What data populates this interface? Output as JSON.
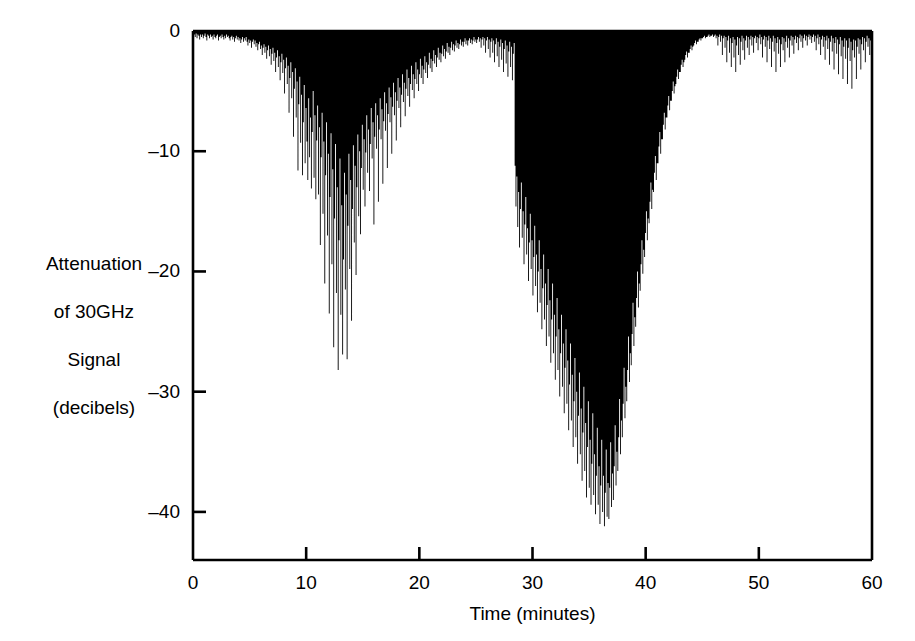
{
  "chart_data": {
    "type": "area",
    "title": "",
    "subtitle": "",
    "xlabel": "Time (minutes)",
    "ylabel": "Attenuation of 30GHz Signal (decibels)",
    "ylabel_lines": [
      "Attenuation",
      "of 30GHz",
      "Signal",
      "(decibels)"
    ],
    "xlim": [
      0,
      60
    ],
    "ylim": [
      -44,
      0
    ],
    "xticks": [
      0,
      10,
      20,
      30,
      40,
      50,
      60
    ],
    "xticklabels": [
      "0",
      "10",
      "20",
      "30",
      "40",
      "50",
      "60"
    ],
    "yticks": [
      0,
      -10,
      -20,
      -30,
      -40
    ],
    "yticklabels": [
      "0",
      "-10",
      "-20",
      "-30",
      "-40"
    ],
    "grid": false,
    "legend": null,
    "legend_position": "none",
    "fill_color": "#000000",
    "axis_color": "#000000",
    "background_color": "#ffffff",
    "series": [
      {
        "name": "30GHz signal attenuation",
        "units": "dB",
        "x_units": "minutes",
        "sample_interval_minutes": 0.1,
        "baseline": 0,
        "description": "Rain-fade record of a 30 GHz satellite beacon over one hour. Two deep fade events: the first near minutes 12-16 reaching about -28 dB, the second near minutes 38-44 reaching about -41 dB.",
        "annotations": [
          "Quiet baseline 0 to -1 dB from 0 to 6 min",
          "First fade onset approx 7 min, peak depth -28 dB near 13.5 min",
          "Partial recovery 17-22 min to about -6 dB",
          "Quiet interval 23-35 min, 0 to -4 dB",
          "Second fade sharp onset approx 36 min",
          "Deepest attenuation -41 dB near 42 min",
          "Recovery by 46 min, residual 0 to -5 dB through 60 min"
        ],
        "values": [
          -0.4,
          -0.3,
          -0.5,
          -0.2,
          -0.6,
          -0.3,
          -0.4,
          -0.7,
          -0.3,
          -0.5,
          -0.3,
          -0.6,
          -0.4,
          -0.2,
          -0.5,
          -0.8,
          -0.3,
          -0.4,
          -0.6,
          -0.3,
          -0.5,
          -0.4,
          -0.7,
          -0.3,
          -0.5,
          -0.6,
          -0.4,
          -0.3,
          -0.8,
          -0.5,
          -0.4,
          -0.6,
          -0.3,
          -0.5,
          -0.7,
          -0.4,
          -0.6,
          -0.3,
          -0.5,
          -0.4,
          -0.6,
          -0.8,
          -0.5,
          -0.4,
          -0.7,
          -0.5,
          -0.9,
          -0.6,
          -0.4,
          -0.7,
          -0.5,
          -0.8,
          -0.6,
          -1.0,
          -0.7,
          -0.5,
          -0.9,
          -0.6,
          -0.8,
          -0.5,
          -0.9,
          -1.2,
          -0.7,
          -1.0,
          -0.8,
          -1.4,
          -0.9,
          -0.7,
          -1.1,
          -0.8,
          -1.3,
          -1.0,
          -1.6,
          -1.1,
          -0.9,
          -1.5,
          -1.2,
          -2.0,
          -1.4,
          -1.1,
          -1.8,
          -1.3,
          -2.3,
          -1.6,
          -1.2,
          -2.1,
          -1.5,
          -2.8,
          -1.9,
          -1.4,
          -2.5,
          -1.8,
          -3.4,
          -2.2,
          -1.6,
          -3.0,
          -2.1,
          -4.1,
          -2.6,
          -1.9,
          -3.5,
          -2.4,
          -5.2,
          -3.1,
          -2.2,
          -4.4,
          -2.9,
          -6.8,
          -3.9,
          -2.6,
          -5.6,
          -3.4,
          -8.8,
          -4.8,
          -3.1,
          -7.2,
          -4.2,
          -11.6,
          -6.1,
          -3.8,
          -9.3,
          -5.3,
          -12.0,
          -7.6,
          -4.5,
          -11.0,
          -6.4,
          -9.2,
          -12.4,
          -5.6,
          -10.5,
          -7.2,
          -13.1,
          -8.4,
          -5.0,
          -12.2,
          -7.0,
          -14.0,
          -9.1,
          -6.2,
          -13.6,
          -8.0,
          -17.8,
          -10.5,
          -6.8,
          -15.2,
          -9.2,
          -21.0,
          -12.0,
          -7.6,
          -17.0,
          -10.2,
          -23.5,
          -13.8,
          -8.5,
          -19.4,
          -11.5,
          -26.3,
          -15.6,
          -9.4,
          -21.8,
          -13.0,
          -28.2,
          -17.4,
          -10.6,
          -23.6,
          -14.5,
          -26.9,
          -19.0,
          -11.8,
          -21.5,
          -13.6,
          -27.3,
          -16.2,
          -10.2,
          -19.8,
          -12.4,
          -24.1,
          -14.8,
          -9.5,
          -17.6,
          -11.2,
          -20.3,
          -13.0,
          -8.6,
          -15.4,
          -10.0,
          -16.9,
          -11.4,
          -7.8,
          -13.2,
          -9.0,
          -14.6,
          -10.1,
          -7.0,
          -11.8,
          -8.2,
          -13.3,
          -9.4,
          -6.4,
          -10.6,
          -7.6,
          -16.1,
          -8.8,
          -6.0,
          -9.8,
          -7.0,
          -14.2,
          -8.2,
          -5.6,
          -9.0,
          -6.5,
          -12.7,
          -7.5,
          -5.1,
          -8.3,
          -6.0,
          -11.4,
          -6.9,
          -4.7,
          -7.6,
          -5.5,
          -10.2,
          -6.3,
          -4.3,
          -7.0,
          -5.1,
          -9.1,
          -5.8,
          -3.9,
          -6.4,
          -4.7,
          -8.0,
          -5.3,
          -3.6,
          -5.9,
          -4.3,
          -7.1,
          -4.8,
          -3.2,
          -5.4,
          -3.9,
          -6.3,
          -4.4,
          -2.9,
          -4.9,
          -3.6,
          -5.6,
          -4.0,
          -2.6,
          -4.4,
          -3.2,
          -5.0,
          -3.6,
          -2.3,
          -3.9,
          -2.9,
          -4.4,
          -3.2,
          -2.1,
          -3.5,
          -2.6,
          -3.9,
          -2.8,
          -1.8,
          -3.1,
          -2.3,
          -3.4,
          -2.5,
          -1.6,
          -2.7,
          -2.0,
          -3.0,
          -2.2,
          -1.4,
          -2.4,
          -1.8,
          -2.6,
          -1.9,
          -1.2,
          -2.1,
          -1.5,
          -2.3,
          -1.7,
          -1.0,
          -1.8,
          -1.3,
          -2.0,
          -1.4,
          -0.9,
          -1.6,
          -1.1,
          -1.7,
          -1.2,
          -0.8,
          -1.4,
          -1.0,
          -1.5,
          -1.1,
          -0.7,
          -1.2,
          -0.9,
          -1.3,
          -0.9,
          -0.6,
          -1.1,
          -0.8,
          -1.2,
          -0.8,
          -0.6,
          -1.0,
          -0.7,
          -1.1,
          -0.8,
          -0.5,
          -0.9,
          -0.7,
          -1.0,
          -0.7,
          -0.5,
          -0.9,
          -0.6,
          -1.4,
          -0.7,
          -0.5,
          -1.2,
          -0.6,
          -1.8,
          -0.8,
          -0.5,
          -1.5,
          -0.7,
          -2.2,
          -0.9,
          -0.6,
          -1.8,
          -0.8,
          -2.6,
          -1.1,
          -0.6,
          -2.1,
          -0.9,
          -3.0,
          -1.3,
          -0.7,
          -2.4,
          -1.0,
          -3.4,
          -1.5,
          -0.8,
          -2.7,
          -1.2,
          -3.8,
          -1.7,
          -0.9,
          -3.0,
          -1.3,
          -4.1,
          -1.9,
          -1.0,
          -11.2,
          -14.6,
          -12.1,
          -16.3,
          -13.4,
          -18.0,
          -14.8,
          -12.6,
          -17.2,
          -15.0,
          -19.4,
          -16.1,
          -13.8,
          -18.6,
          -16.4,
          -20.8,
          -17.6,
          -15.2,
          -19.8,
          -17.4,
          -22.0,
          -18.8,
          -16.2,
          -21.2,
          -18.6,
          -23.4,
          -20.0,
          -17.4,
          -22.6,
          -19.8,
          -24.8,
          -21.4,
          -18.6,
          -24.0,
          -21.0,
          -26.2,
          -22.8,
          -19.8,
          -25.4,
          -22.4,
          -27.6,
          -24.0,
          -21.0,
          -26.8,
          -23.6,
          -29.0,
          -25.4,
          -22.2,
          -28.2,
          -24.8,
          -30.4,
          -26.8,
          -23.6,
          -29.6,
          -26.0,
          -31.8,
          -28.0,
          -24.8,
          -31.0,
          -27.4,
          -33.2,
          -29.4,
          -26.0,
          -32.4,
          -28.6,
          -34.6,
          -30.8,
          -27.2,
          -33.8,
          -30.0,
          -36.0,
          -32.0,
          -28.4,
          -35.2,
          -31.4,
          -37.4,
          -33.4,
          -29.6,
          -36.6,
          -32.6,
          -38.8,
          -34.6,
          -30.8,
          -38.0,
          -34.0,
          -39.4,
          -36.0,
          -31.8,
          -38.6,
          -35.2,
          -40.2,
          -37.0,
          -33.0,
          -39.4,
          -36.2,
          -41.0,
          -37.8,
          -34.0,
          -40.0,
          -37.0,
          -41.2,
          -38.4,
          -34.8,
          -40.4,
          -37.6,
          -40.6,
          -38.0,
          -34.2,
          -39.6,
          -36.8,
          -39.0,
          -36.2,
          -32.8,
          -37.8,
          -35.0,
          -36.6,
          -33.8,
          -30.6,
          -35.2,
          -32.4,
          -33.8,
          -31.0,
          -28.0,
          -32.2,
          -29.6,
          -30.8,
          -28.2,
          -25.4,
          -29.2,
          -26.8,
          -27.8,
          -25.2,
          -22.6,
          -26.2,
          -23.8,
          -24.6,
          -22.2,
          -20.0,
          -23.0,
          -21.0,
          -21.6,
          -19.4,
          -17.4,
          -20.2,
          -18.2,
          -18.8,
          -16.8,
          -15.0,
          -17.4,
          -15.6,
          -16.0,
          -14.2,
          -12.6,
          -14.8,
          -13.2,
          -13.4,
          -11.8,
          -10.4,
          -12.4,
          -11.0,
          -11.0,
          -9.6,
          -8.4,
          -10.2,
          -9.0,
          -9.0,
          -7.8,
          -6.8,
          -8.2,
          -7.2,
          -7.2,
          -6.2,
          -5.4,
          -6.6,
          -5.8,
          -5.8,
          -5.0,
          -4.2,
          -5.2,
          -4.6,
          -4.4,
          -3.8,
          -3.2,
          -4.0,
          -3.4,
          -3.4,
          -2.8,
          -2.4,
          -3.0,
          -2.6,
          -2.4,
          -2.0,
          -1.7,
          -2.2,
          -1.8,
          -1.8,
          -1.5,
          -1.2,
          -1.6,
          -1.3,
          -1.2,
          -1.0,
          -0.8,
          -1.1,
          -0.9,
          -0.9,
          -0.7,
          -0.6,
          -0.8,
          -0.6,
          -0.6,
          -0.5,
          -0.4,
          -0.6,
          -0.5,
          -0.5,
          -0.4,
          -0.3,
          -0.5,
          -0.4,
          -0.4,
          -0.3,
          -0.5,
          -0.4,
          -0.3,
          -0.6,
          -0.4,
          -1.2,
          -0.5,
          -0.3,
          -0.9,
          -0.4,
          -2.0,
          -0.6,
          -0.4,
          -1.4,
          -0.5,
          -2.6,
          -0.8,
          -0.4,
          -1.8,
          -0.6,
          -3.0,
          -1.0,
          -0.5,
          -2.2,
          -0.7,
          -3.4,
          -1.2,
          -0.5,
          -2.0,
          -0.6,
          -2.8,
          -0.9,
          -0.4,
          -1.6,
          -0.6,
          -2.4,
          -0.8,
          -0.4,
          -1.4,
          -0.5,
          -2.0,
          -0.7,
          -0.4,
          -1.2,
          -0.5,
          -1.8,
          -0.6,
          -0.4,
          -1.0,
          -0.5,
          -1.6,
          -0.6,
          -0.3,
          -1.1,
          -0.5,
          -2.2,
          -0.7,
          -0.4,
          -1.3,
          -0.5,
          -2.6,
          -0.8,
          -0.4,
          -1.5,
          -0.6,
          -3.0,
          -0.9,
          -0.4,
          -1.7,
          -0.6,
          -3.4,
          -1.0,
          -0.5,
          -1.9,
          -0.7,
          -3.0,
          -1.1,
          -0.5,
          -1.6,
          -0.6,
          -2.6,
          -0.9,
          -0.4,
          -1.4,
          -0.6,
          -2.2,
          -0.8,
          -0.4,
          -1.2,
          -0.5,
          -1.9,
          -0.7,
          -0.4,
          -1.0,
          -0.5,
          -1.6,
          -0.6,
          -0.3,
          -0.9,
          -0.4,
          -1.4,
          -0.6,
          -0.3,
          -0.8,
          -0.4,
          -1.2,
          -0.5,
          -0.3,
          -0.7,
          -0.4,
          -1.0,
          -0.5,
          -0.3,
          -0.9,
          -0.4,
          -1.6,
          -0.6,
          -0.3,
          -1.1,
          -0.5,
          -2.0,
          -0.7,
          -0.4,
          -1.3,
          -0.5,
          -2.4,
          -0.8,
          -0.4,
          -1.5,
          -0.6,
          -2.8,
          -0.9,
          -0.4,
          -1.7,
          -0.6,
          -3.2,
          -1.0,
          -0.5,
          -1.9,
          -0.7,
          -3.6,
          -1.1,
          -0.5,
          -2.1,
          -0.8,
          -4.0,
          -1.3,
          -0.6,
          -2.3,
          -0.8,
          -4.4,
          -1.4,
          -0.6,
          -2.5,
          -0.9,
          -4.8,
          -1.6,
          -0.7,
          -2.2,
          -0.8,
          -4.0,
          -1.3,
          -0.6,
          -1.9,
          -0.7,
          -3.2,
          -1.1,
          -0.5,
          -1.6,
          -0.6,
          -2.6,
          -0.9,
          -0.4,
          -1.3,
          -0.6,
          -2.0,
          -0.8,
          -0.4
        ]
      }
    ]
  }
}
